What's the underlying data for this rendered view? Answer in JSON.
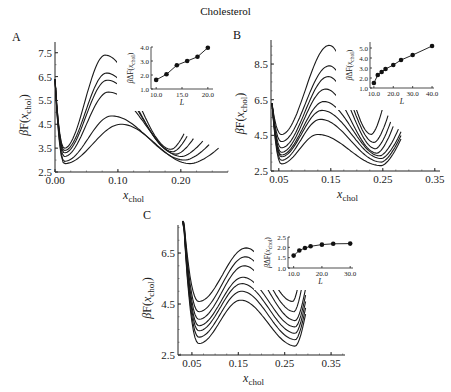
{
  "figure_title": "Cholesterol",
  "panels": [
    {
      "label": "A"
    },
    {
      "label": "B"
    },
    {
      "label": "C"
    }
  ],
  "chart_data": [
    {
      "panel": "A",
      "type": "line",
      "title": "",
      "xlabel": "x_chol",
      "ylabel": "βF(x_chol)",
      "xlim": [
        0.0,
        0.27
      ],
      "ylim": [
        2.5,
        7.9
      ],
      "xticks": [
        "0.00",
        "0.10",
        "0.20"
      ],
      "yticks": [
        "2.5",
        "3.5",
        "4.5",
        "5.5",
        "6.5",
        "7.5"
      ],
      "series_description": "6 free-energy curves: steep drop near x=0, minimum near x≈0.015, barrier peak near x≈0.08–0.10, second minimum near x≈0.18–0.22",
      "series": [
        {
          "name": "curve1",
          "min1": 3.5,
          "peak": 7.4,
          "peak_x": 0.08,
          "min2": 3.45,
          "end_x": 0.205
        },
        {
          "name": "curve2",
          "min1": 3.4,
          "peak": 6.65,
          "peak_x": 0.082,
          "min2": 3.35,
          "end_x": 0.21
        },
        {
          "name": "curve3",
          "min1": 3.3,
          "peak": 6.35,
          "peak_x": 0.083,
          "min2": 3.25,
          "end_x": 0.22
        },
        {
          "name": "curve4",
          "min1": 3.15,
          "peak": 5.85,
          "peak_x": 0.085,
          "min2": 3.15,
          "end_x": 0.235
        },
        {
          "name": "curve5",
          "min1": 2.95,
          "peak": 4.85,
          "peak_x": 0.09,
          "min2": 3.0,
          "end_x": 0.245
        },
        {
          "name": "curve6",
          "min1": 2.85,
          "peak": 4.5,
          "peak_x": 0.105,
          "min2": 2.85,
          "end_x": 0.26
        }
      ],
      "inset": {
        "type": "line",
        "xlabel": "L",
        "ylabel": "βΔF(x_chol)",
        "xticks": [
          "10.0",
          "15.0",
          "20.0"
        ],
        "yticks": [
          "1.0",
          "2.0",
          "3.0",
          "4.0"
        ],
        "xlim": [
          9,
          21
        ],
        "ylim": [
          1.0,
          4.0
        ],
        "x": [
          10,
          12,
          14,
          16,
          18,
          20
        ],
        "y": [
          1.65,
          2.05,
          2.7,
          3.0,
          3.3,
          3.95
        ]
      }
    },
    {
      "panel": "B",
      "type": "line",
      "title": "",
      "xlabel": "x_chol",
      "ylabel": "βF(x_chol)",
      "xlim": [
        0.035,
        0.36
      ],
      "ylim": [
        2.5,
        9.7
      ],
      "xticks": [
        "0.05",
        "0.15",
        "0.25",
        "0.35"
      ],
      "yticks": [
        "2.5",
        "4.5",
        "6.5",
        "8.5"
      ],
      "series_description": "8 free-energy curves with barrier peak near x≈0.13–0.15 and minima near x≈0.05 and x≈0.23",
      "series": [
        {
          "name": "curve1",
          "min1": 4.55,
          "peak": 9.55,
          "peak_x": 0.147,
          "min2": 4.55,
          "end_x": 0.25
        },
        {
          "name": "curve2",
          "min1": 4.15,
          "peak": 8.4,
          "peak_x": 0.147,
          "min2": 4.1,
          "end_x": 0.26
        },
        {
          "name": "curve3",
          "min1": 3.8,
          "peak": 7.8,
          "peak_x": 0.145,
          "min2": 3.75,
          "end_x": 0.265
        },
        {
          "name": "curve4",
          "min1": 3.55,
          "peak": 7.1,
          "peak_x": 0.14,
          "min2": 3.5,
          "end_x": 0.27
        },
        {
          "name": "curve5",
          "min1": 3.4,
          "peak": 6.4,
          "peak_x": 0.137,
          "min2": 3.35,
          "end_x": 0.28
        },
        {
          "name": "curve6",
          "min1": 3.3,
          "peak": 5.9,
          "peak_x": 0.133,
          "min2": 3.2,
          "end_x": 0.285
        },
        {
          "name": "curve7",
          "min1": 3.1,
          "peak": 5.4,
          "peak_x": 0.13,
          "min2": 3.0,
          "end_x": 0.285
        },
        {
          "name": "curve8",
          "min1": 2.9,
          "peak": 4.55,
          "peak_x": 0.125,
          "min2": 2.8,
          "end_x": 0.285
        }
      ],
      "inset": {
        "type": "line",
        "xlabel": "L",
        "ylabel": "βΔF(x_chol)",
        "xticks": [
          "10.0",
          "20.0",
          "30.0",
          "40.0"
        ],
        "yticks": [
          "1.0",
          "2.0",
          "3.0",
          "4.0",
          "5.0"
        ],
        "xlim": [
          8,
          41
        ],
        "ylim": [
          1.0,
          5.6
        ],
        "x": [
          10,
          12,
          14,
          16,
          20,
          24,
          30,
          40
        ],
        "y": [
          1.5,
          2.3,
          2.6,
          2.9,
          3.3,
          3.8,
          4.3,
          5.2
        ]
      }
    },
    {
      "panel": "C",
      "type": "line",
      "title": "",
      "xlabel": "x_chol",
      "ylabel": "βF(x_chol)",
      "xlim": [
        0.02,
        0.38
      ],
      "ylim": [
        2.5,
        7.3
      ],
      "xticks": [
        "0.05",
        "0.15",
        "0.25",
        "0.35"
      ],
      "yticks": [
        "2.5",
        "4.5",
        "6.5"
      ],
      "series_description": "7 free-energy curves with barrier peak near x≈0.16–0.17 and minima near x≈0.06 and x≈0.27",
      "series": [
        {
          "name": "curve1",
          "min1": 4.6,
          "peak": 6.7,
          "peak_x": 0.167,
          "min2": 4.6,
          "end_x": 0.285
        },
        {
          "name": "curve2",
          "min1": 4.2,
          "peak": 6.35,
          "peak_x": 0.165,
          "min2": 4.2,
          "end_x": 0.29
        },
        {
          "name": "curve3",
          "min1": 3.9,
          "peak": 6.0,
          "peak_x": 0.163,
          "min2": 3.85,
          "end_x": 0.295
        },
        {
          "name": "curve4",
          "min1": 3.65,
          "peak": 5.55,
          "peak_x": 0.16,
          "min2": 3.6,
          "end_x": 0.295
        },
        {
          "name": "curve5",
          "min1": 3.45,
          "peak": 5.3,
          "peak_x": 0.158,
          "min2": 3.35,
          "end_x": 0.295
        },
        {
          "name": "curve6",
          "min1": 3.2,
          "peak": 5.0,
          "peak_x": 0.157,
          "min2": 3.1,
          "end_x": 0.295
        },
        {
          "name": "curve7",
          "min1": 2.95,
          "peak": 4.65,
          "peak_x": 0.155,
          "min2": 2.85,
          "end_x": 0.295
        }
      ],
      "inset": {
        "type": "line",
        "xlabel": "L",
        "ylabel": "βΔF(x_chol)",
        "xticks": [
          "10.0",
          "20.0",
          "30.0"
        ],
        "yticks": [
          "1.0",
          "1.5",
          "2.0",
          "2.5"
        ],
        "xlim": [
          8,
          31
        ],
        "ylim": [
          1.0,
          2.5
        ],
        "x": [
          10,
          12,
          14,
          16,
          20,
          24,
          30
        ],
        "y": [
          1.6,
          1.85,
          1.97,
          2.05,
          2.13,
          2.17,
          2.18
        ]
      }
    }
  ]
}
